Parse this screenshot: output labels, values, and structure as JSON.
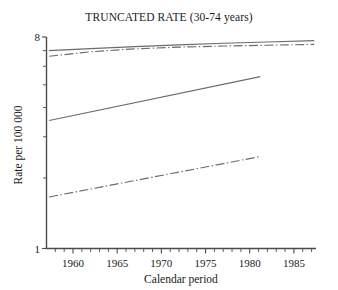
{
  "chart_data": {
    "type": "line",
    "title": "TRUNCATED RATE (30-74 years)",
    "xlabel": "Calendar period",
    "ylabel": "Rate per 100 000",
    "yscale": "log",
    "ylim": [
      1,
      8
    ],
    "xlim": [
      1957,
      1987.5
    ],
    "grid": false,
    "legend": "none",
    "y_tick_labels": [
      "8",
      "1"
    ],
    "y_tick_values": [
      8,
      1
    ],
    "y_minor_ticks": [
      2,
      3,
      4,
      5,
      6,
      7
    ],
    "x_tick_labels": [
      "1960",
      "1965",
      "1970",
      "1975",
      "1980",
      "1985"
    ],
    "x_tick_values": [
      1960,
      1965,
      1970,
      1975,
      1980,
      1985
    ],
    "x_minor_tick_step": 1,
    "series": [
      {
        "name": "series-1-upper-solid",
        "style": "solid",
        "color": "#6b6b6b",
        "x": [
          1957.3,
          1962,
          1967,
          1972,
          1977,
          1982,
          1987.3
        ],
        "values": [
          7.0,
          7.14,
          7.28,
          7.4,
          7.52,
          7.62,
          7.72
        ]
      },
      {
        "name": "series-2-upper-dashdot",
        "style": "dash-dot",
        "color": "#6b6b6b",
        "x": [
          1957.3,
          1962,
          1967,
          1972,
          1977,
          1982,
          1987.3
        ],
        "values": [
          6.62,
          6.92,
          7.12,
          7.24,
          7.32,
          7.38,
          7.44
        ]
      },
      {
        "name": "series-3-middle-solid",
        "style": "solid",
        "color": "#6b6b6b",
        "x": [
          1957.3,
          1981.2
        ],
        "values": [
          3.52,
          5.42
        ]
      },
      {
        "name": "series-4-lower-dashdot",
        "style": "dash-dot",
        "color": "#6b6b6b",
        "x": [
          1957.3,
          1981.2
        ],
        "values": [
          1.66,
          2.47
        ]
      }
    ]
  },
  "axes": {
    "y_top_label": "8",
    "y_bottom_label": "1",
    "y_axis_title": "Rate per 100 000",
    "x_axis_title": "Calendar period"
  }
}
